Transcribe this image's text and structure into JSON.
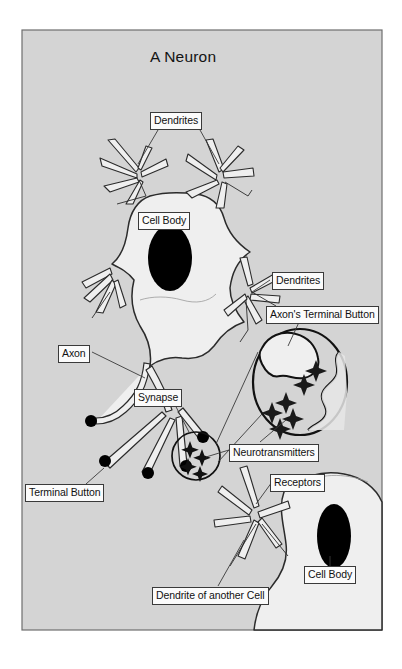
{
  "figure": {
    "title": "A Neuron",
    "frame": {
      "x": 22,
      "y": 30,
      "width": 360,
      "height": 600
    },
    "background_color": "#d4d4d4",
    "page_color": "#ffffff",
    "border_color": "#6e6e6e"
  },
  "colors": {
    "cell_fill": "#efefef",
    "nucleus": "#000000",
    "outline": "#2b2b2b",
    "terminal_button": "#000000",
    "label_fill": "#fbfbfb",
    "label_border": "#3a3a3a",
    "leader_line": "#3a3a3a"
  },
  "labels": [
    {
      "id": "dendrites-top",
      "text": "Dendrites",
      "x": 150,
      "y": 112
    },
    {
      "id": "cell-body-main",
      "text": "Cell Body",
      "x": 138,
      "y": 212
    },
    {
      "id": "dendrites-right",
      "text": "Dendrites",
      "x": 272,
      "y": 272
    },
    {
      "id": "axons-terminal-button",
      "text": "Axon's Terminal Button",
      "x": 266,
      "y": 306
    },
    {
      "id": "axon",
      "text": "Axon",
      "x": 58,
      "y": 345
    },
    {
      "id": "synapse",
      "text": "Synapse",
      "x": 134,
      "y": 389
    },
    {
      "id": "neurotransmitters",
      "text": "Neurotransmitters",
      "x": 229,
      "y": 444
    },
    {
      "id": "receptors",
      "text": "Receptors",
      "x": 270,
      "y": 474
    },
    {
      "id": "terminal-button",
      "text": "Terminal Button",
      "x": 25,
      "y": 484
    },
    {
      "id": "cell-body-other",
      "text": "Cell Body",
      "x": 304,
      "y": 566
    },
    {
      "id": "dendrite-another-cell",
      "text": "Dendrite of another Cell",
      "x": 152,
      "y": 587
    }
  ],
  "structures": {
    "main_neuron": {
      "name": "presynaptic neuron",
      "nucleus": {
        "cx": 170,
        "cy": 258,
        "rx": 22,
        "ry": 33
      },
      "dendrite_clusters": 4,
      "terminal_buttons": 5
    },
    "postsynaptic_neuron": {
      "name": "receiving cell",
      "nucleus": {
        "cx": 334,
        "cy": 536,
        "rx": 17,
        "ry": 32
      }
    },
    "synapse_circle": {
      "cx": 196,
      "cy": 456,
      "r": 24
    },
    "magnified_synapse": {
      "cx": 300,
      "cy": 382,
      "rx": 47,
      "ry": 53,
      "neurotransmitter_count": 6
    }
  }
}
